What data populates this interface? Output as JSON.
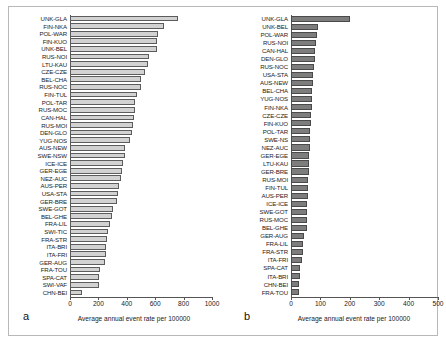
{
  "figure": {
    "background": "#ffffff",
    "border_color": "#b8b8b8"
  },
  "panels": [
    {
      "letter": "a",
      "name": "panel-a",
      "bar_fill": "#d2d2d2",
      "bar_stroke": "#5c5c5c"
    },
    {
      "letter": "b",
      "name": "panel-b",
      "bar_fill": "#7d7d7d",
      "bar_stroke": "#4a4a4a"
    }
  ],
  "chart_data": [
    {
      "type": "bar",
      "orientation": "horizontal",
      "panel": "a",
      "title": "",
      "xlabel": "Average annual event rate per 100000",
      "ylabel": "",
      "xlim": [
        0,
        1000
      ],
      "xticks": [
        0,
        200,
        400,
        600,
        800,
        1000
      ],
      "xticklabels": [
        "0",
        "200",
        "400",
        "600",
        "800",
        "1000"
      ],
      "grid": false,
      "legend": "none",
      "bar_color": "#d2d2d2",
      "categories": [
        "UNK-GLA",
        "FIN-NKA",
        "POL-WAR",
        "FIN-KUO",
        "UNK-BEL",
        "RUS-NOI",
        "LTU-KAU",
        "CZE-CZE",
        "BEL-CHA",
        "RUS-NOC",
        "FIN-TUL",
        "POL-TAR",
        "RUS-MOC",
        "CAN-HAL",
        "RUS-MOI",
        "DEN-GLO",
        "YUG-NOS",
        "AUS-NEW",
        "SWE-NSW",
        "ICE-ICE",
        "GER-EGE",
        "NEZ-AUC",
        "AUS-PER",
        "USA-STA",
        "GER-BRE",
        "SWE-GOT",
        "BEL-GHE",
        "FRA-LIL",
        "SWI-TIC",
        "FRA-STR",
        "ITA-BRI",
        "ITA-FRI",
        "GER-AUG",
        "FRA-TOU",
        "SPA-CAT",
        "SWI-VAF",
        "CHN-BEI"
      ],
      "values": [
        760,
        660,
        620,
        615,
        612,
        553,
        548,
        525,
        500,
        497,
        470,
        460,
        455,
        450,
        445,
        437,
        420,
        390,
        385,
        370,
        367,
        360,
        342,
        338,
        333,
        300,
        295,
        285,
        268,
        262,
        255,
        250,
        247,
        213,
        207,
        205,
        85
      ]
    },
    {
      "type": "bar",
      "orientation": "horizontal",
      "panel": "b",
      "title": "",
      "xlabel": "Average annual event rate per 100000",
      "ylabel": "",
      "xlim": [
        0,
        500
      ],
      "xticks": [
        0,
        100,
        200,
        300,
        400,
        500
      ],
      "xticklabels": [
        "0",
        "100",
        "200",
        "300",
        "400",
        "500"
      ],
      "grid": false,
      "legend": "none",
      "bar_color": "#7d7d7d",
      "categories": [
        "UNK-GLA",
        "UNK-BEL",
        "POL-WAR",
        "RUS-NOI",
        "CAN-HAL",
        "DEN-GLO",
        "RUS-NOC",
        "USA-STA",
        "AUS-NEW",
        "BEL-CHA",
        "YUG-NOS",
        "FIN-NKA",
        "CZE-CZE",
        "FIN-KUO",
        "POL-TAR",
        "SWE-NS",
        "NEZ-AUC",
        "GER-EGE",
        "LTU-KAU",
        "GER-BRE",
        "RUS-MOI",
        "FIN-TUL",
        "AUS-PER",
        "ICE-ICE",
        "SWE-GOT",
        "RUS-MOC",
        "BEL-GHE",
        "GER-AUG",
        "FRA-LIL",
        "FRA-STR",
        "ITA-FRI",
        "SPA-CAT",
        "ITA-BRI",
        "CHN-BEI",
        "FRA-TOU"
      ],
      "values": [
        200,
        92,
        90,
        85,
        83,
        80,
        79,
        76,
        74,
        73,
        72,
        70,
        69,
        67,
        66,
        64,
        63,
        62,
        61,
        60,
        59,
        58,
        57,
        56,
        55,
        54,
        53,
        43,
        42,
        40,
        38,
        32,
        30,
        28,
        27
      ]
    }
  ]
}
